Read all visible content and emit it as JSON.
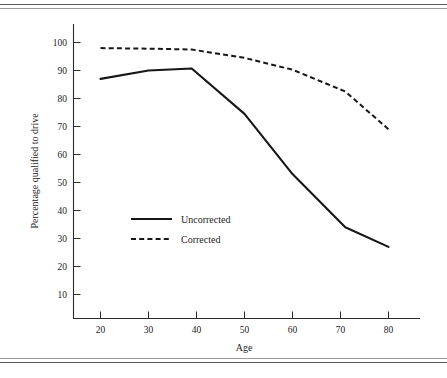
{
  "chart_data": {
    "type": "line",
    "title": "",
    "xlabel": "Age",
    "ylabel": "Percentage qualified to drive",
    "xlim": [
      14,
      88
    ],
    "ylim": [
      4,
      104
    ],
    "grid": false,
    "legend_position": "inside-center-left",
    "x_ticks": [
      20,
      30,
      40,
      50,
      60,
      70,
      80
    ],
    "y_ticks": [
      10,
      20,
      30,
      40,
      50,
      60,
      70,
      80,
      90,
      100
    ],
    "series": [
      {
        "name": "Uncorrected",
        "style": "solid",
        "x": [
          20,
          30,
          39,
          50,
          60,
          71,
          80
        ],
        "values": [
          87,
          90,
          90.7,
          74.5,
          53,
          34,
          27
        ]
      },
      {
        "name": "Corrected",
        "style": "dashed",
        "x": [
          20,
          30,
          39,
          50,
          60,
          71,
          80
        ],
        "values": [
          98,
          97.8,
          97.5,
          94.5,
          90.3,
          82.5,
          69
        ]
      }
    ]
  },
  "axes": {
    "y_title": "Percentage qualified to drive",
    "x_title": "Age",
    "y_tick_labels": [
      "100",
      "90",
      "80",
      "70",
      "60",
      "50",
      "40",
      "30",
      "20",
      "10"
    ],
    "x_tick_labels": [
      "20",
      "30",
      "40",
      "50",
      "60",
      "70",
      "80"
    ]
  },
  "legend": {
    "entries": [
      {
        "label": "Uncorrected",
        "style": "solid"
      },
      {
        "label": "Corrected",
        "style": "dashed"
      }
    ]
  },
  "colors": {
    "ink": "#171719",
    "axis": "#2a2a2d",
    "rule": "#59595c",
    "background": "#ffffff"
  }
}
